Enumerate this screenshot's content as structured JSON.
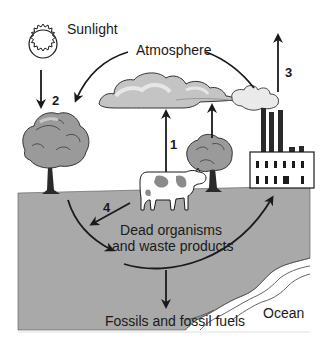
{
  "diagram": {
    "type": "carbon-cycle",
    "labels": {
      "sunlight": "Sunlight",
      "atmosphere": "Atmosphere",
      "dead_organisms_line1": "Dead organisms",
      "dead_organisms_line2": "and waste products",
      "fossils": "Fossils and fossil fuels",
      "ocean": "Ocean"
    },
    "arrow_numbers": {
      "arrow1": "1",
      "arrow2": "2",
      "arrow3": "3",
      "arrow4": "4"
    },
    "elements": [
      {
        "id": "sun",
        "label": "Sunlight"
      },
      {
        "id": "clouds",
        "label": "Atmosphere"
      },
      {
        "id": "tree-left"
      },
      {
        "id": "tree-right"
      },
      {
        "id": "cow"
      },
      {
        "id": "factory"
      },
      {
        "id": "ground"
      },
      {
        "id": "ocean",
        "label": "Ocean"
      }
    ],
    "arrows": [
      {
        "number": "1",
        "from": "dead organisms",
        "to": "atmosphere",
        "direction": "up"
      },
      {
        "number": "2",
        "from": "sunlight",
        "to": "tree",
        "direction": "down"
      },
      {
        "number": "3",
        "from": "factory",
        "to": "atmosphere",
        "direction": "up"
      },
      {
        "number": "4",
        "from": "cow",
        "to": "dead organisms",
        "direction": "down-left"
      },
      {
        "number": "",
        "from": "atmosphere",
        "to": "tree",
        "direction": "curved"
      },
      {
        "number": "",
        "from": "factory smoke",
        "to": "atmosphere",
        "direction": "curved"
      },
      {
        "number": "",
        "from": "tree",
        "to": "dead organisms",
        "direction": "curved"
      },
      {
        "number": "",
        "from": "dead organisms",
        "to": "factory",
        "direction": "curved"
      },
      {
        "number": "",
        "from": "dead organisms",
        "to": "fossils",
        "direction": "down"
      },
      {
        "number": "",
        "from": "tree-right",
        "to": "atmosphere",
        "direction": "up"
      }
    ],
    "colors": {
      "ground": "#a9a9a9",
      "cloud_fill": "#c4c4c4",
      "cloud_highlight": "#e6e6e6",
      "tree_canopy": "#9a9a9a",
      "tree_trunk": "#2a2a2a",
      "ink": "#1a1a1a",
      "background": "#ffffff"
    }
  }
}
